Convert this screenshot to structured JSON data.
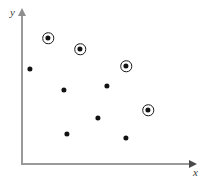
{
  "chart_data": {
    "type": "scatter",
    "title": "",
    "subtitle": "",
    "xlabel": "x",
    "ylabel": "y",
    "grid": false,
    "legend": false,
    "axis_style": "arrow-terminated quadrant axes, no tick marks, no tick labels",
    "xlim": [
      0,
      100
    ],
    "ylim": [
      0,
      100
    ],
    "annotations": [],
    "series": [
      {
        "name": "circled points",
        "marker": "filled dot with surrounding ring",
        "color": "#121212",
        "points": [
          {
            "label": "A",
            "x": 15,
            "y": 86,
            "px": 48,
            "py": 38,
            "circled": true
          },
          {
            "label": "B",
            "x": 34,
            "y": 78,
            "px": 80,
            "py": 49,
            "circled": true
          },
          {
            "label": "C",
            "x": 61,
            "y": 66,
            "px": 126,
            "py": 66,
            "circled": true
          },
          {
            "label": "D",
            "x": 74,
            "y": 37,
            "px": 148,
            "py": 110,
            "circled": true
          }
        ]
      },
      {
        "name": "plain points",
        "marker": "filled dot",
        "color": "#121212",
        "points": [
          {
            "label": "E",
            "x": 5,
            "y": 64,
            "px": 30,
            "py": 69,
            "circled": false
          },
          {
            "label": "F",
            "x": 25,
            "y": 50,
            "px": 64,
            "py": 90,
            "circled": false
          },
          {
            "label": "G",
            "x": 50,
            "y": 52,
            "px": 107,
            "py": 86,
            "circled": false
          },
          {
            "label": "H",
            "x": 45,
            "y": 31,
            "px": 98,
            "py": 118,
            "circled": false
          },
          {
            "label": "I",
            "x": 27,
            "y": 20,
            "px": 67,
            "py": 134,
            "circled": false
          },
          {
            "label": "J",
            "x": 61,
            "y": 17,
            "px": 126,
            "py": 138,
            "circled": false
          }
        ]
      }
    ]
  },
  "figure": {
    "y_axis_label": "y",
    "x_axis_label": "x"
  }
}
